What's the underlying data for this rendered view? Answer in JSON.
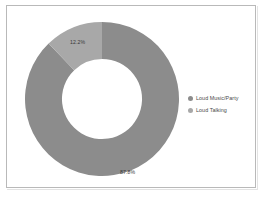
{
  "chart_data": {
    "type": "pie",
    "variant": "donut",
    "title": "",
    "subtitle": "",
    "xlabel": "",
    "ylabel": "",
    "categories": [
      "Loud Music/Party",
      "Loud Talking"
    ],
    "values": [
      87.8,
      12.2
    ],
    "value_unit": "%",
    "data_labels": [
      "87.8%",
      "12.2%"
    ],
    "colors": [
      "#8c8c8c",
      "#a8a8a8"
    ],
    "legend": {
      "position": "right",
      "entries": [
        {
          "label": "Loud Music/Party",
          "color": "#8c8c8c",
          "marker": "circle"
        },
        {
          "label": "Loud Talking",
          "color": "#a8a8a8",
          "marker": "circle"
        }
      ]
    },
    "grid": false,
    "start_angle_deg": 0,
    "direction": "clockwise",
    "inner_radius_ratio": 0.52
  },
  "chart": {
    "slices": [
      {
        "name": "Loud Music/Party",
        "label": "87.8%",
        "percent": 87.8,
        "color": "#8c8c8c"
      },
      {
        "name": "Loud Talking",
        "label": "12.2%",
        "percent": 12.2,
        "color": "#a8a8a8"
      }
    ],
    "border_color": "#b9b9b9",
    "background": "#ffffff",
    "label_color": "#3a3a3a"
  },
  "legend": {
    "items": [
      {
        "label": "Loud Music/Party",
        "color": "#8c8c8c"
      },
      {
        "label": "Loud Talking",
        "color": "#a8a8a8"
      }
    ]
  }
}
